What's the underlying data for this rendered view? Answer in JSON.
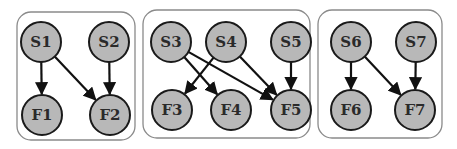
{
  "diagram": {
    "groups": [
      {
        "id": "g1",
        "x": 17,
        "y": 12,
        "w": 118,
        "h": 128,
        "r": 14
      },
      {
        "id": "g2",
        "x": 143,
        "y": 10,
        "w": 167,
        "h": 128,
        "r": 14
      },
      {
        "id": "g3",
        "x": 318,
        "y": 10,
        "w": 124,
        "h": 128,
        "r": 14
      }
    ],
    "nodes": [
      {
        "id": "S1",
        "label": "S1",
        "x": 41,
        "y": 42
      },
      {
        "id": "S2",
        "label": "S2",
        "x": 109,
        "y": 42
      },
      {
        "id": "F1",
        "label": "F1",
        "x": 42,
        "y": 115
      },
      {
        "id": "F2",
        "label": "F2",
        "x": 110,
        "y": 115
      },
      {
        "id": "S3",
        "label": "S3",
        "x": 171,
        "y": 42
      },
      {
        "id": "S4",
        "label": "S4",
        "x": 226,
        "y": 42
      },
      {
        "id": "S5",
        "label": "S5",
        "x": 291,
        "y": 42
      },
      {
        "id": "F3",
        "label": "F3",
        "x": 172,
        "y": 110
      },
      {
        "id": "F4",
        "label": "F4",
        "x": 231,
        "y": 110
      },
      {
        "id": "F5",
        "label": "F5",
        "x": 291,
        "y": 110
      },
      {
        "id": "S6",
        "label": "S6",
        "x": 351,
        "y": 42
      },
      {
        "id": "S7",
        "label": "S7",
        "x": 416,
        "y": 42
      },
      {
        "id": "F6",
        "label": "F6",
        "x": 351,
        "y": 110
      },
      {
        "id": "F7",
        "label": "F7",
        "x": 415,
        "y": 110
      }
    ],
    "edges": [
      {
        "from": "S1",
        "to": "F1"
      },
      {
        "from": "S1",
        "to": "F2"
      },
      {
        "from": "S2",
        "to": "F2"
      },
      {
        "from": "S3",
        "to": "F4"
      },
      {
        "from": "S3",
        "to": "F5"
      },
      {
        "from": "S4",
        "to": "F3"
      },
      {
        "from": "S4",
        "to": "F5"
      },
      {
        "from": "S5",
        "to": "F5"
      },
      {
        "from": "S6",
        "to": "F6"
      },
      {
        "from": "S6",
        "to": "F7"
      },
      {
        "from": "S7",
        "to": "F7"
      }
    ],
    "node_radius": 20,
    "colors": {
      "node_fill": "#b8b8b8",
      "node_stroke": "#1a1a1a",
      "box_stroke": "#8a8a8a",
      "edge": "#111111"
    }
  }
}
